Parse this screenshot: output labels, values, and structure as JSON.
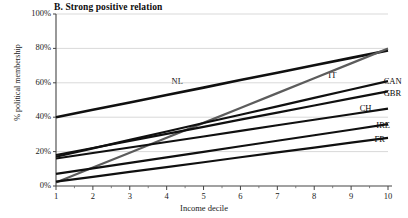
{
  "chart_data": {
    "type": "line",
    "title": "B. Strong positive relation",
    "subtitle": "",
    "xlabel": "Income decile",
    "ylabel": "% political membership",
    "x": [
      1,
      2,
      3,
      4,
      5,
      6,
      7,
      8,
      9,
      10
    ],
    "xtick_labels": [
      "1",
      "2",
      "3",
      "4",
      "5",
      "6",
      "7",
      "8",
      "9",
      "10"
    ],
    "ytick_labels": [
      "0%",
      "20%",
      "40%",
      "60%",
      "80%",
      "100%"
    ],
    "ytick_values": [
      0,
      20,
      40,
      60,
      80,
      100
    ],
    "xlim": [
      1,
      10
    ],
    "ylim": [
      0,
      100
    ],
    "grid": "horizontal",
    "legend_position": "inline-right-end",
    "series": [
      {
        "name": "NL",
        "label": "NL",
        "color": "#101010",
        "width": 2.6,
        "label_x": 4.35,
        "label_y": 60.5,
        "values": [
          40.0,
          44.3,
          48.6,
          52.9,
          57.2,
          61.6,
          65.9,
          70.2,
          74.5,
          78.8
        ]
      },
      {
        "name": "IT",
        "label": "IT",
        "color": "#5c5c5c",
        "width": 2.2,
        "label_x": 8.6,
        "label_y": 64.0,
        "values": [
          2.0,
          10.7,
          19.3,
          28.0,
          36.7,
          45.3,
          54.0,
          62.7,
          71.3,
          80.0
        ]
      },
      {
        "name": "CAN",
        "label": "CAN",
        "color": "#101010",
        "width": 2.2,
        "label_x": 10.1,
        "label_y": 60.5,
        "values": [
          17.0,
          21.9,
          26.8,
          31.7,
          36.6,
          41.4,
          46.3,
          51.2,
          56.1,
          61.0
        ]
      },
      {
        "name": "GBR",
        "label": "GBR",
        "color": "#101010",
        "width": 2.2,
        "label_x": 10.1,
        "label_y": 53.5,
        "values": [
          18.0,
          22.1,
          26.2,
          30.3,
          34.4,
          38.6,
          42.7,
          46.8,
          50.9,
          55.0
        ]
      },
      {
        "name": "CH",
        "label": "CH",
        "color": "#101010",
        "width": 2.2,
        "label_x": 9.45,
        "label_y": 44.5,
        "values": [
          16.0,
          19.2,
          22.4,
          25.6,
          28.8,
          32.1,
          35.3,
          38.5,
          41.7,
          45.0
        ]
      },
      {
        "name": "IRE",
        "label": "IRE",
        "color": "#101010",
        "width": 2.2,
        "label_x": 9.9,
        "label_y": 35.0,
        "values": [
          7.0,
          10.2,
          13.4,
          16.6,
          19.8,
          23.1,
          26.3,
          29.5,
          32.7,
          36.0
        ]
      },
      {
        "name": "FR",
        "label": "FR",
        "color": "#101010",
        "width": 2.2,
        "label_x": 9.85,
        "label_y": 26.5,
        "values": [
          2.5,
          5.3,
          8.2,
          11.0,
          13.8,
          16.7,
          19.5,
          22.3,
          25.2,
          28.0
        ]
      }
    ]
  }
}
